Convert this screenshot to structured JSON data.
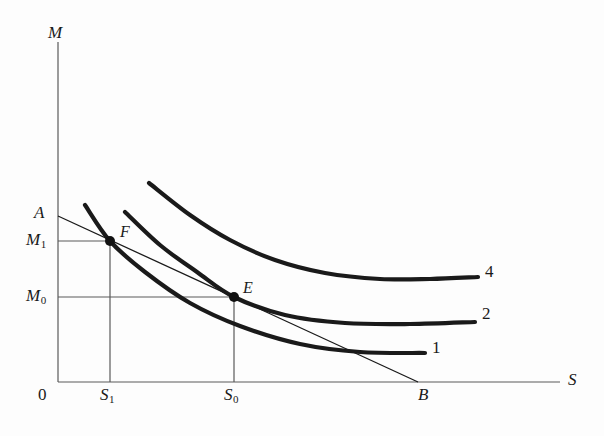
{
  "figure": {
    "kind": "economics-indifference-curve-diagram",
    "background_color": "#fdfdfd",
    "ink_color": "#1a1a1a",
    "axes": {
      "y_axis_label": "M",
      "x_axis_label": "S",
      "origin_label": "0"
    },
    "value_labels": {
      "a_intercept": "A",
      "b_intercept": "B",
      "m_high": "M",
      "m_high_sub": "1",
      "m_low": "M",
      "m_low_sub": "0",
      "s_low": "S",
      "s_low_sub": "1",
      "s_high": "S",
      "s_high_sub": "0"
    },
    "points": [
      {
        "name": "F",
        "label": "F",
        "x": 110,
        "y": 241
      },
      {
        "name": "E",
        "label": "E",
        "x": 234,
        "y": 297
      }
    ],
    "curve_labels": [
      {
        "id": "curve-4",
        "label": "4",
        "x": 485,
        "y": 271
      },
      {
        "id": "curve-2",
        "label": "2",
        "x": 482,
        "y": 313
      },
      {
        "id": "curve-1",
        "label": "1",
        "x": 432,
        "y": 346
      }
    ]
  },
  "chart_data": {
    "type": "line",
    "title": "",
    "xlabel": "S",
    "ylabel": "M",
    "grid": false,
    "legend": "inline-right-end-labels",
    "xlim": [
      0,
      604
    ],
    "ylim": [
      0,
      436
    ],
    "axis_pixels": {
      "y_axis_x": 58,
      "y_axis_top": 42,
      "x_axis_y": 382,
      "x_axis_left": 58,
      "x_axis_right": 560
    },
    "annotations": [
      {
        "text": "A",
        "x": 40,
        "y": 213,
        "note": "budget line vertical intercept label"
      },
      {
        "text": "B",
        "x": 425,
        "y": 395,
        "note": "budget line horizontal intercept label"
      },
      {
        "text": "F",
        "x": 120,
        "y": 232,
        "note": "tangency of budget line AB with indifference curve 1"
      },
      {
        "text": "E",
        "x": 243,
        "y": 288,
        "note": "tangency of budget line AB with indifference curve 2"
      }
    ],
    "series": [
      {
        "name": "budget-line-AB",
        "style": "thin-straight",
        "stroke_width": 1.3,
        "points": [
          [
            58,
            216
          ],
          [
            418,
            382
          ]
        ]
      },
      {
        "name": "indifference-curve-1",
        "label": "1",
        "style": "thick-convex",
        "stroke_width": 4.2,
        "points": [
          [
            85,
            205
          ],
          [
            110,
            241
          ],
          [
            145,
            272
          ],
          [
            190,
            303
          ],
          [
            240,
            326
          ],
          [
            300,
            344
          ],
          [
            360,
            352
          ],
          [
            425,
            353
          ]
        ]
      },
      {
        "name": "indifference-curve-2",
        "label": "2",
        "style": "thick-convex",
        "stroke_width": 4.2,
        "points": [
          [
            125,
            212
          ],
          [
            160,
            245
          ],
          [
            197,
            272
          ],
          [
            234,
            297
          ],
          [
            285,
            315
          ],
          [
            345,
            323
          ],
          [
            410,
            324
          ],
          [
            475,
            322
          ]
        ]
      },
      {
        "name": "indifference-curve-4",
        "label": "4",
        "style": "thick-convex",
        "stroke_width": 4.2,
        "points": [
          [
            149,
            183
          ],
          [
            190,
            215
          ],
          [
            230,
            240
          ],
          [
            275,
            260
          ],
          [
            325,
            273
          ],
          [
            380,
            279
          ],
          [
            430,
            279
          ],
          [
            478,
            277
          ]
        ]
      }
    ],
    "guide_lines": [
      {
        "name": "M1-horizontal",
        "points": [
          [
            58,
            241
          ],
          [
            110,
            241
          ]
        ]
      },
      {
        "name": "M0-horizontal",
        "points": [
          [
            58,
            297
          ],
          [
            234,
            297
          ]
        ]
      },
      {
        "name": "S1-vertical",
        "points": [
          [
            110,
            241
          ],
          [
            110,
            382
          ]
        ]
      },
      {
        "name": "S0-vertical",
        "points": [
          [
            234,
            297
          ],
          [
            234,
            382
          ]
        ]
      }
    ],
    "tick_positions": {
      "S1_x": 110,
      "S0_x": 234,
      "M1_y": 241,
      "M0_y": 297
    }
  }
}
